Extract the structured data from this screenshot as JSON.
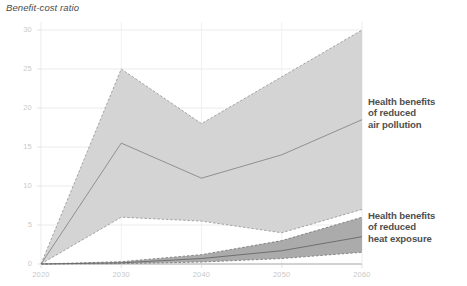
{
  "chart_data": {
    "type": "area",
    "title": "Benefit-cost ratio",
    "ylabel": "Benefit-cost ratio",
    "xlabel": "",
    "x": [
      2020,
      2030,
      2040,
      2050,
      2060
    ],
    "xtick_labels": [
      "2020",
      "2030",
      "2040",
      "2050",
      "2060"
    ],
    "ytick_labels": [
      "0",
      "5",
      "10",
      "15",
      "20",
      "25",
      "30"
    ],
    "yticks": [
      0,
      5,
      10,
      15,
      20,
      25,
      30
    ],
    "ylim": [
      0,
      30
    ],
    "xlim": [
      2020,
      2060
    ],
    "grid": "horizontal",
    "legend_position": "right-inline",
    "series": [
      {
        "name": "Health benefits of reduced air pollution",
        "label_text": "Health benefits\nof reduced\nair pollution",
        "band_color": "#d2d2d2",
        "line_color": "#8c8c8c",
        "edge_style": "dashed",
        "central": [
          0,
          15.5,
          11,
          14,
          18.5
        ],
        "upper": [
          0,
          25,
          18,
          24,
          30
        ],
        "lower": [
          0,
          6,
          5.5,
          4,
          7
        ]
      },
      {
        "name": "Health benefits of reduced heat exposure",
        "label_text": "Health benefits\nof reduced\nheat exposure",
        "band_color": "#a6a6a6",
        "line_color": "#6b6b6b",
        "edge_style": "dashed",
        "central": [
          0,
          0.15,
          0.7,
          1.7,
          3.5
        ],
        "upper": [
          0,
          0.3,
          1.2,
          3.0,
          6.0
        ],
        "lower": [
          0,
          0.05,
          0.25,
          0.7,
          1.5
        ]
      }
    ]
  },
  "chart": {
    "title": "Benefit-cost ratio"
  }
}
